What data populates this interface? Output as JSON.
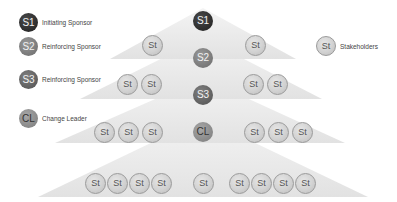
{
  "legend": [
    {
      "abbr": "S1",
      "label": "Initiating Sponsor",
      "color": "#2b2b2b"
    },
    {
      "abbr": "S2",
      "label": "Reinforcing Sponsor",
      "color": "#7a7a7a"
    },
    {
      "abbr": "S3",
      "label": "Reinforcing Sponsor",
      "color": "#5f5f5f"
    },
    {
      "abbr": "CL",
      "label": "Change Leader",
      "color": "#8c8c8c"
    }
  ],
  "stakeholder_legend": {
    "abbr": "St",
    "label": "Stakeholders"
  },
  "hierarchy": {
    "center": [
      {
        "abbr": "S1",
        "color": "#2b2b2b"
      },
      {
        "abbr": "S2",
        "color": "#7a7a7a"
      },
      {
        "abbr": "S3",
        "color": "#5f5f5f"
      },
      {
        "abbr": "CL",
        "color": "#8c8c8c"
      },
      {
        "abbr": "St"
      }
    ],
    "tiers": [
      {
        "left": [
          "St"
        ],
        "right": [
          "St"
        ]
      },
      {
        "left": [
          "St",
          "St"
        ],
        "right": [
          "St",
          "St"
        ]
      },
      {
        "left": [
          "St",
          "St",
          "St"
        ],
        "right": [
          "St",
          "St",
          "St"
        ]
      },
      {
        "left": [
          "St",
          "St",
          "St",
          "St"
        ],
        "right": [
          "St",
          "St",
          "St",
          "St"
        ]
      }
    ]
  }
}
